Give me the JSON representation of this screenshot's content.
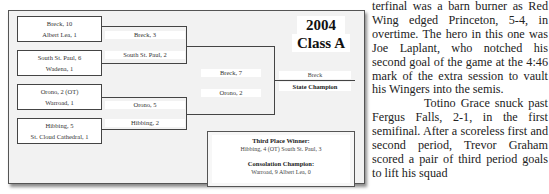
{
  "bracket": {
    "year": "2004",
    "class": "Class A",
    "quarterfinals": [
      {
        "winner": "Breck, 10",
        "loser": "Albert Lea, 1"
      },
      {
        "winner": "South St. Paul, 6",
        "loser": "Wadena, 1"
      },
      {
        "winner": "Orono, 2 (OT)",
        "loser": "Warroad, 1"
      },
      {
        "winner": "Hibbing, 5",
        "loser": "St. Cloud Cathedral, 1"
      }
    ],
    "semifinals": [
      {
        "winner": "Breck, 3",
        "loser": "South St. Paul, 2"
      },
      {
        "winner": "Orono, 5",
        "loser": "Hibbing, 2"
      }
    ],
    "final": {
      "winner": "Breck, 7",
      "loser": "Orono, 2"
    },
    "champion": {
      "name": "Breck",
      "label": "State Champion"
    },
    "third_place": {
      "heading": "Third Place Winner:",
      "result": "Hibbing, 4 (OT)  South St. Paul, 3"
    },
    "consolation": {
      "heading": "Consolation Champion:",
      "result": "Warroad, 9  Albert Lea, 0"
    }
  },
  "article": {
    "paragraph1": "terfinal was a barn burner as Red Wing edged Princeton, 5-4, in overtime. The hero in this one was Joe Laplant, who notched his second goal of the game at the 4:46 mark of the extra session to vault his Wingers into the semis.",
    "paragraph2": "Totino Grace snuck past Fergus Falls, 2-1, in the first semifinal. After a scoreless first and second period, Trevor Graham scored a pair of third period goals to lift his squad"
  }
}
